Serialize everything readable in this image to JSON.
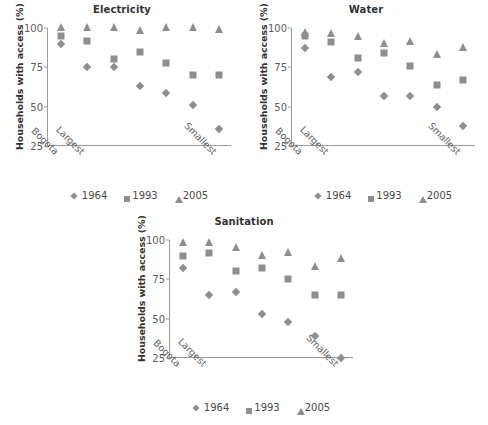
{
  "figure": {
    "ylabel": "Households with access (%)",
    "marker_color": "#8e8e8e",
    "axis_color": "#9a9a9a",
    "legend": [
      {
        "label": "1964",
        "marker": "diamond-marker-icon"
      },
      {
        "label": "1993",
        "marker": "square-marker-icon"
      },
      {
        "label": "2005",
        "marker": "triangle-marker-icon"
      }
    ],
    "yticks": [
      "25",
      "50",
      "75",
      "100"
    ],
    "xticks": [
      "Bogota",
      "Largest",
      "Smallest"
    ]
  },
  "chart_data": [
    {
      "type": "scatter",
      "title": "Electricity",
      "xlabel": "",
      "ylabel": "Households with access (%)",
      "ylim": [
        25,
        100
      ],
      "yticks": [
        25,
        50,
        75,
        100
      ],
      "grid": false,
      "legend_position": "below",
      "categories": [
        "Bogota",
        "Largest",
        "3",
        "4",
        "5",
        "6",
        "Smallest"
      ],
      "category_tick_labels": [
        "Bogota",
        "Largest",
        "",
        "",
        "",
        "",
        "Smallest"
      ],
      "series": [
        {
          "name": "1964",
          "marker": "diamond",
          "values": [
            90,
            75,
            75,
            63,
            59,
            51,
            36
          ]
        },
        {
          "name": "1993",
          "marker": "square",
          "values": [
            95,
            92,
            80,
            85,
            78,
            70,
            70
          ]
        },
        {
          "name": "2005",
          "marker": "triangle",
          "values": [
            100,
            100,
            100,
            98,
            100,
            100,
            99
          ]
        }
      ]
    },
    {
      "type": "scatter",
      "title": "Water",
      "xlabel": "",
      "ylabel": "Households with access (%)",
      "ylim": [
        25,
        100
      ],
      "yticks": [
        25,
        50,
        75,
        100
      ],
      "grid": false,
      "legend_position": "below",
      "categories": [
        "Bogota",
        "Largest",
        "3",
        "4",
        "5",
        "6",
        "Smallest"
      ],
      "category_tick_labels": [
        "Bogota",
        "Largest",
        "",
        "",
        "",
        "",
        "Smallest"
      ],
      "series": [
        {
          "name": "1964",
          "marker": "diamond",
          "values": [
            87,
            69,
            72,
            57,
            57,
            50,
            38
          ]
        },
        {
          "name": "1993",
          "marker": "square",
          "values": [
            95,
            91,
            81,
            84,
            76,
            64,
            67
          ]
        },
        {
          "name": "2005",
          "marker": "triangle",
          "values": [
            97,
            96,
            94,
            90,
            91,
            83,
            87
          ]
        }
      ]
    },
    {
      "type": "scatter",
      "title": "Sanitation",
      "xlabel": "",
      "ylabel": "Households with access (%)",
      "ylim": [
        25,
        100
      ],
      "yticks": [
        25,
        50,
        75,
        100
      ],
      "grid": false,
      "legend_position": "below",
      "categories": [
        "Bogota",
        "Largest",
        "3",
        "4",
        "5",
        "6",
        "Smallest"
      ],
      "category_tick_labels": [
        "Bogota",
        "Largest",
        "",
        "",
        "",
        "",
        "Smallest"
      ],
      "series": [
        {
          "name": "1964",
          "marker": "diamond",
          "values": [
            82,
            65,
            67,
            53,
            48,
            39,
            25
          ]
        },
        {
          "name": "1993",
          "marker": "square",
          "values": [
            90,
            92,
            80,
            82,
            75,
            65,
            65
          ]
        },
        {
          "name": "2005",
          "marker": "triangle",
          "values": [
            98,
            98,
            95,
            90,
            92,
            83,
            88
          ]
        }
      ]
    }
  ]
}
